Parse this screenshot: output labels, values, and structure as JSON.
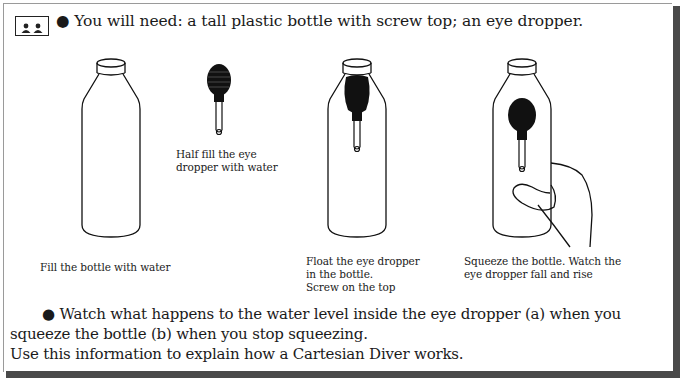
{
  "heading": {
    "bullet": "●",
    "text": "You will need: a tall plastic bottle with screw top; an eye dropper."
  },
  "icons": {
    "activity_icon": "pair-work-icon"
  },
  "steps": [
    {
      "caption": "Fill the bottle with water",
      "illustration": "empty-bottle"
    },
    {
      "caption": "Half fill the eye\ndropper with water",
      "illustration": "eye-dropper"
    },
    {
      "caption": "Float the eye dropper\nin the bottle.\nScrew on the top",
      "illustration": "bottle-with-dropper"
    },
    {
      "caption": "Squeeze the bottle. Watch the\neye dropper fall and rise",
      "illustration": "hand-squeezing-bottle"
    }
  ],
  "instructions": {
    "bullet": "●",
    "line1": "Watch what happens to the water level inside the eye dropper (a) when you",
    "line2": "squeeze the bottle (b) when you stop squeezing.",
    "line3": "Use this information to explain how a Cartesian Diver works."
  }
}
